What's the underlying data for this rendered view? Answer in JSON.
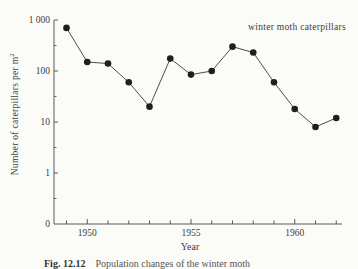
{
  "page": {
    "background": "#fbfbf8",
    "text_color": "#3d3d3d"
  },
  "chart_data": {
    "type": "line",
    "series_label": "winter moth caterpillars",
    "xlabel": "Year",
    "ylabel_base": "Number of caterpillars per m",
    "ylabel_exponent": "2",
    "y_scale": "log",
    "grid": false,
    "marker": "filled-circle",
    "x": [
      1949,
      1950,
      1951,
      1952,
      1953,
      1954,
      1955,
      1956,
      1957,
      1958,
      1959,
      1960,
      1961,
      1962
    ],
    "values": [
      700,
      150,
      140,
      60,
      20,
      175,
      85,
      100,
      300,
      230,
      60,
      18,
      8,
      12
    ],
    "y_tick_labels": [
      "1 000",
      "100",
      "10",
      "1",
      "0"
    ],
    "y_tick_values": [
      1000,
      100,
      10,
      1,
      0
    ],
    "x_labeled_ticks": [
      "1950",
      "1955",
      "1960"
    ],
    "x_labeled_years": [
      1950,
      1955,
      1960
    ],
    "x_tick_every_year": true,
    "colors": {
      "line": "#3a3a3a",
      "marker": "#1f1f1f",
      "axis": "#5a5a5a",
      "text": "#3d3d3d"
    }
  },
  "caption": {
    "prefix": "Fig. 12.12",
    "text": "Population changes of the winter moth"
  }
}
